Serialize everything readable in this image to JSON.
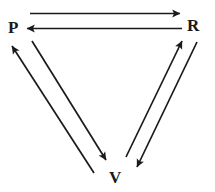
{
  "diagram": {
    "type": "node-edge-diagram",
    "background_color": "#ffffff",
    "stroke_color": "#1a1a1a",
    "nodes": [
      {
        "id": "P",
        "label": "P",
        "position": "top-left",
        "x": 14,
        "y": 28
      },
      {
        "id": "R",
        "label": "R",
        "position": "top-right",
        "x": 193,
        "y": 25
      },
      {
        "id": "V",
        "label": "V",
        "position": "bottom-center",
        "x": 116,
        "y": 177
      }
    ],
    "edges": [
      {
        "id": "p-to-r",
        "from": "P",
        "to": "R",
        "direction": "right",
        "arrowhead": "end",
        "style": "straight"
      },
      {
        "id": "r-to-p",
        "from": "R",
        "to": "P",
        "direction": "left",
        "arrowhead": "end",
        "style": "straight"
      },
      {
        "id": "p-to-v",
        "from": "P",
        "to": "V",
        "direction": "down-right",
        "arrowhead": "end",
        "style": "straight"
      },
      {
        "id": "v-to-p",
        "from": "V",
        "to": "P",
        "direction": "up-left",
        "arrowhead": "end",
        "style": "straight"
      },
      {
        "id": "v-to-r",
        "from": "V",
        "to": "R",
        "direction": "up-right",
        "arrowhead": "end",
        "style": "straight"
      },
      {
        "id": "r-to-v",
        "from": "R",
        "to": "V",
        "direction": "down-left",
        "arrowhead": "end",
        "style": "straight"
      }
    ]
  }
}
